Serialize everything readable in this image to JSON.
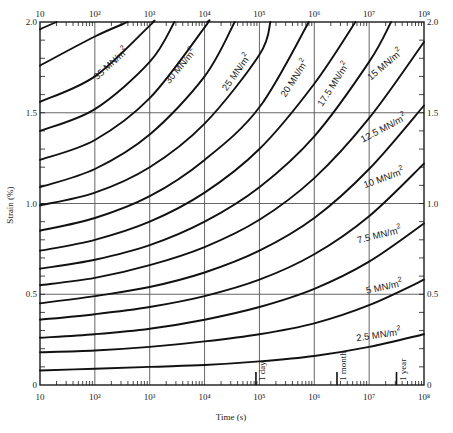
{
  "chart_data": {
    "type": "line",
    "title": "",
    "xlabel": "Time (s)",
    "ylabel": "Strain (%)",
    "xscale": "log",
    "xlim": [
      10,
      100000000
    ],
    "ylim": [
      0,
      2.0
    ],
    "grid": true,
    "x_tick_labels": [
      "10",
      "10²",
      "10³",
      "10⁴",
      "10⁵",
      "10⁶",
      "10⁷",
      "10⁸"
    ],
    "y_tick_labels": [
      "0",
      "0.5",
      "1.0",
      "1.5",
      "2.0"
    ],
    "y_ticks": [
      0,
      0.5,
      1.0,
      1.5,
      2.0
    ],
    "x_log_decades": [
      1,
      2,
      3,
      4,
      5,
      6,
      7,
      8
    ],
    "time_markers": [
      {
        "label": "1 day",
        "seconds": 86400
      },
      {
        "label": "1 month",
        "seconds": 2592000
      },
      {
        "label": "1 year",
        "seconds": 31536000
      }
    ],
    "series": [
      {
        "name": "2.5 MN/m²",
        "stress": 2.5,
        "labeled": true,
        "x_log": [
          1,
          2,
          3,
          4,
          5,
          6,
          7,
          8
        ],
        "values": [
          0.08,
          0.09,
          0.1,
          0.11,
          0.13,
          0.16,
          0.21,
          0.28
        ]
      },
      {
        "name": "5 MN/m²",
        "stress": 5,
        "labeled": true,
        "x_log": [
          1,
          2,
          3,
          4,
          5,
          6,
          7,
          8
        ],
        "values": [
          0.18,
          0.19,
          0.21,
          0.24,
          0.28,
          0.34,
          0.44,
          0.58
        ]
      },
      {
        "name": "7.5 MN/m²",
        "stress": 7.5,
        "labeled": true,
        "x_log": [
          1,
          2,
          3,
          4,
          5,
          6,
          7,
          8
        ],
        "values": [
          0.26,
          0.28,
          0.31,
          0.36,
          0.43,
          0.53,
          0.68,
          0.89
        ]
      },
      {
        "name": "10 MN/m²",
        "stress": 10,
        "labeled": true,
        "x_log": [
          1,
          2,
          3,
          4,
          5,
          6,
          7,
          8
        ],
        "values": [
          0.36,
          0.39,
          0.43,
          0.49,
          0.58,
          0.72,
          0.93,
          1.22
        ]
      },
      {
        "name": "12.5 MN/m²",
        "stress": 12.5,
        "labeled": true,
        "x_log": [
          1,
          2,
          3,
          4,
          5,
          6,
          7,
          8
        ],
        "values": [
          0.45,
          0.49,
          0.54,
          0.62,
          0.74,
          0.92,
          1.19,
          1.54
        ]
      },
      {
        "name": "15 MN/m²",
        "stress": 15,
        "labeled": true,
        "x_log": [
          1,
          2,
          3,
          4,
          5,
          6,
          7,
          8
        ],
        "values": [
          0.55,
          0.59,
          0.66,
          0.76,
          0.91,
          1.14,
          1.47,
          1.89
        ]
      },
      {
        "name": "17.5 MN/m²",
        "stress": 17.5,
        "labeled": true,
        "x_log": [
          1,
          2,
          3,
          4,
          5,
          6,
          7,
          7.4
        ],
        "values": [
          0.64,
          0.69,
          0.77,
          0.9,
          1.09,
          1.37,
          1.78,
          2.0
        ]
      },
      {
        "name": "20 MN/m²",
        "stress": 20,
        "labeled": true,
        "x_log": [
          1,
          2,
          3,
          4,
          5,
          6,
          6.75
        ],
        "values": [
          0.74,
          0.8,
          0.9,
          1.06,
          1.3,
          1.66,
          2.0
        ]
      },
      {
        "name": "22.5 MN/m²",
        "stress": 22.5,
        "labeled": false,
        "x_log": [
          1,
          2,
          3,
          4,
          5,
          5.9
        ],
        "values": [
          0.85,
          0.92,
          1.04,
          1.24,
          1.53,
          2.0
        ]
      },
      {
        "name": "25 MN/m²",
        "stress": 25,
        "labeled": true,
        "x_log": [
          1,
          2,
          3,
          4,
          5,
          5.2
        ],
        "values": [
          0.99,
          1.06,
          1.2,
          1.44,
          1.82,
          2.0
        ]
      },
      {
        "name": "27.5 MN/m²",
        "stress": 27.5,
        "labeled": false,
        "x_log": [
          1,
          2,
          3,
          4,
          4.55
        ],
        "values": [
          1.09,
          1.19,
          1.38,
          1.7,
          2.0
        ]
      },
      {
        "name": "30 MN/m²",
        "stress": 30,
        "labeled": true,
        "x_log": [
          1,
          2,
          3,
          4,
          4.05
        ],
        "values": [
          1.24,
          1.35,
          1.58,
          1.97,
          2.0
        ]
      },
      {
        "name": "32.5 MN/m²",
        "stress": 32.5,
        "labeled": false,
        "x_log": [
          1,
          2,
          3,
          3.45
        ],
        "values": [
          1.4,
          1.52,
          1.78,
          2.0
        ]
      },
      {
        "name": "35 MN/m²",
        "stress": 35,
        "labeled": true,
        "x_log": [
          1,
          2,
          3,
          3.05
        ],
        "values": [
          1.56,
          1.7,
          1.98,
          2.0
        ]
      },
      {
        "name": "37.5 MN/m²",
        "stress": 37.5,
        "labeled": false,
        "x_log": [
          1,
          2,
          2.6
        ],
        "values": [
          1.76,
          1.92,
          2.0
        ]
      },
      {
        "name": "40 MN/m²",
        "stress": 40,
        "labeled": false,
        "x_log": [
          1,
          1.3
        ],
        "values": [
          1.96,
          2.0
        ]
      }
    ]
  },
  "labels": {
    "curve_labels": [
      {
        "text": "35 MN/m",
        "sup": "2",
        "x": 113,
        "y": 66,
        "rot": -42
      },
      {
        "text": "30 MN/m",
        "sup": "2",
        "x": 183,
        "y": 68,
        "rot": -50
      },
      {
        "text": "25 MN/m",
        "sup": "2",
        "x": 239,
        "y": 74,
        "rot": -55
      },
      {
        "text": "20 MN/m",
        "sup": "2",
        "x": 297,
        "y": 80,
        "rot": -57
      },
      {
        "text": "17.5 MN/m",
        "sup": "2",
        "x": 336,
        "y": 86,
        "rot": -57
      },
      {
        "text": "15 MN/m",
        "sup": "2",
        "x": 387,
        "y": 67,
        "rot": -40
      },
      {
        "text": "12.5 MN/m",
        "sup": "2",
        "x": 385,
        "y": 131,
        "rot": -28
      },
      {
        "text": "10 MN/m",
        "sup": "2",
        "x": 385,
        "y": 181,
        "rot": -20
      },
      {
        "text": "7.5 MN/m",
        "sup": "2",
        "x": 380,
        "y": 238,
        "rot": -14
      },
      {
        "text": "5 MN/m",
        "sup": "2",
        "x": 385,
        "y": 290,
        "rot": -12
      },
      {
        "text": "2.5 MN/m",
        "sup": "2",
        "x": 379,
        "y": 338,
        "rot": -8
      }
    ]
  }
}
